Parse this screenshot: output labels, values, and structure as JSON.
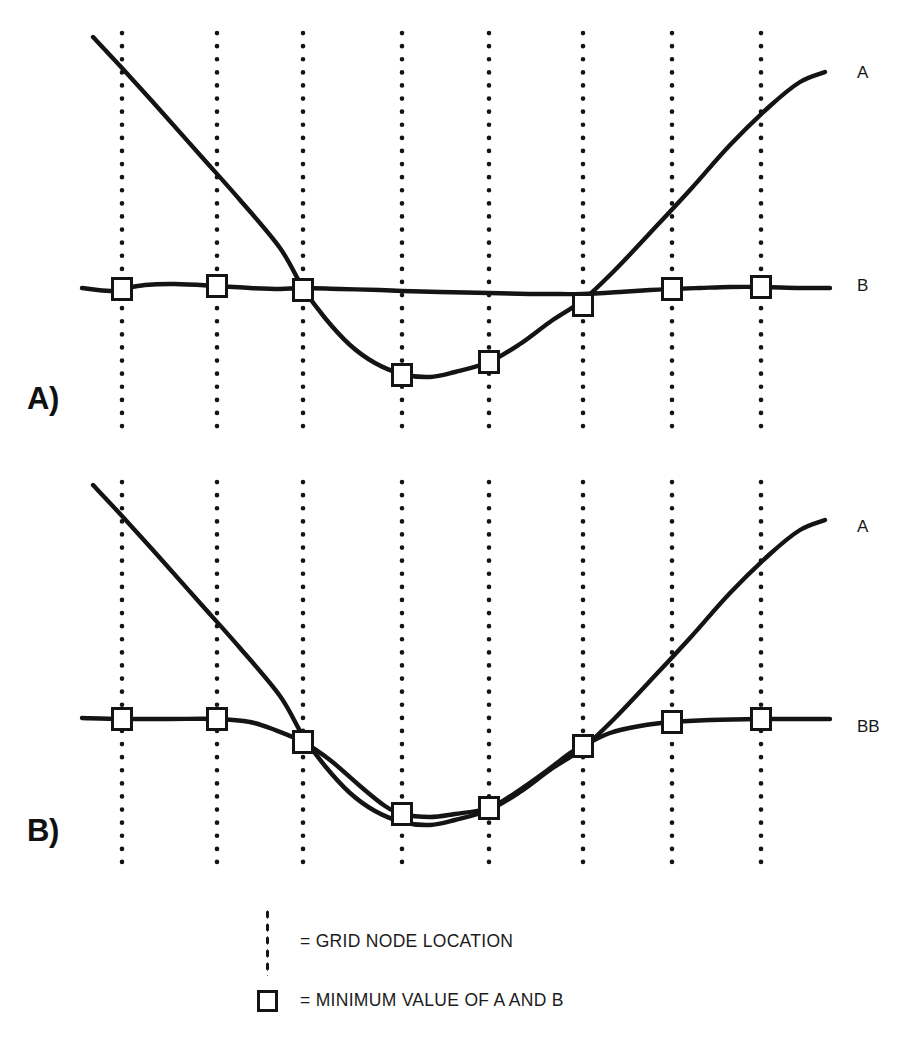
{
  "figure": {
    "background_color": "#ffffff",
    "ink_color": "#141414",
    "panels": [
      {
        "id": "A",
        "caption": "A)",
        "curve_labels": [
          {
            "text": "A",
            "x": 857,
            "y": 64
          },
          {
            "text": "B",
            "x": 857,
            "y": 277
          }
        ]
      },
      {
        "id": "B",
        "caption": "B)",
        "curve_labels": [
          {
            "text": "A",
            "x": 857,
            "y": 518
          },
          {
            "text": "BB",
            "x": 857,
            "y": 718
          }
        ]
      }
    ]
  },
  "legend": {
    "items": [
      {
        "icon": "grid-node-dotted-line-icon",
        "text": "= GRID NODE LOCATION"
      },
      {
        "icon": "minimum-value-square-icon",
        "text": "= MINIMUM VALUE OF A AND B"
      }
    ]
  },
  "bottom_caption": {
    "text": ""
  },
  "chart_data": {
    "type": "line",
    "title": "",
    "xlabel": "",
    "ylabel": "",
    "grid": true,
    "legend_position": "bottom",
    "xlim": [
      0,
      911
    ],
    "ylim_panel_a": [
      30,
      440
    ],
    "ylim_panel_b": [
      480,
      880
    ],
    "grid_nodes": {
      "label": "GRID NODE LOCATION",
      "style": "dotted vertical line",
      "x": [
        122,
        217,
        303,
        402,
        489,
        583,
        672,
        761
      ],
      "panel_a_extent": [
        33,
        437
      ],
      "panel_b_extent": [
        482,
        862
      ]
    },
    "markers": {
      "label": "MINIMUM VALUE OF A AND B",
      "style": "open square",
      "size": 19
    },
    "panel_a": {
      "label": "A)",
      "series": [
        {
          "name": "A",
          "comment": "steep descending limb, parabolic trough, steep ascending limb",
          "points": [
            [
              93,
              37
            ],
            [
              122,
              68
            ],
            [
              160,
              110
            ],
            [
              200,
              155
            ],
            [
              240,
              200
            ],
            [
              280,
              248
            ],
            [
              303,
              288
            ],
            [
              325,
              318
            ],
            [
              350,
              345
            ],
            [
              375,
              363
            ],
            [
              402,
              374
            ],
            [
              430,
              377
            ],
            [
              455,
              372
            ],
            [
              489,
              362
            ],
            [
              520,
              344
            ],
            [
              550,
              322
            ],
            [
              583,
              300
            ],
            [
              615,
              270
            ],
            [
              650,
              233
            ],
            [
              690,
              190
            ],
            [
              730,
              145
            ],
            [
              770,
              106
            ],
            [
              800,
              82
            ],
            [
              825,
              72
            ]
          ]
        },
        {
          "name": "B",
          "comment": "near-horizontal gently undulating curve",
          "points": [
            [
              82,
              288
            ],
            [
              110,
              291
            ],
            [
              122,
              289
            ],
            [
              145,
              285
            ],
            [
              175,
              284
            ],
            [
              217,
              286
            ],
            [
              250,
              288
            ],
            [
              280,
              289
            ],
            [
              303,
              288
            ],
            [
              340,
              289
            ],
            [
              380,
              290
            ],
            [
              402,
              291
            ],
            [
              440,
              292
            ],
            [
              489,
              293
            ],
            [
              530,
              294
            ],
            [
              560,
              294
            ],
            [
              583,
              294
            ],
            [
              620,
              292
            ],
            [
              650,
              290
            ],
            [
              672,
              289
            ],
            [
              700,
              288
            ],
            [
              730,
              287
            ],
            [
              761,
              287
            ],
            [
              800,
              288
            ],
            [
              830,
              288
            ]
          ]
        }
      ],
      "markers": [
        {
          "x": 122,
          "y": 289,
          "on": "B"
        },
        {
          "x": 217,
          "y": 286,
          "on": "B"
        },
        {
          "x": 303,
          "y": 290,
          "on": "B"
        },
        {
          "x": 402,
          "y": 375,
          "on": "A"
        },
        {
          "x": 489,
          "y": 362,
          "on": "A"
        },
        {
          "x": 583,
          "y": 305,
          "on": "A"
        },
        {
          "x": 672,
          "y": 289,
          "on": "B"
        },
        {
          "x": 761,
          "y": 287,
          "on": "B"
        }
      ]
    },
    "panel_b": {
      "label": "B)",
      "series": [
        {
          "name": "A",
          "comment": "same V / parabola form as panel A, shifted down by 455 px",
          "points": [
            [
              93,
              485
            ],
            [
              122,
              516
            ],
            [
              160,
              558
            ],
            [
              200,
              603
            ],
            [
              240,
              648
            ],
            [
              280,
              696
            ],
            [
              303,
              736
            ],
            [
              325,
              766
            ],
            [
              350,
              793
            ],
            [
              375,
              811
            ],
            [
              402,
              822
            ],
            [
              430,
              825
            ],
            [
              455,
              820
            ],
            [
              489,
              810
            ],
            [
              520,
              792
            ],
            [
              550,
              770
            ],
            [
              583,
              748
            ],
            [
              615,
              718
            ],
            [
              650,
              681
            ],
            [
              690,
              638
            ],
            [
              730,
              593
            ],
            [
              770,
              554
            ],
            [
              800,
              530
            ],
            [
              825,
              520
            ]
          ]
        },
        {
          "name": "BB",
          "comment": "smoothed envelope of min(A,B): flat, dips through trough, flat again",
          "points": [
            [
              82,
              718
            ],
            [
              122,
              719
            ],
            [
              170,
              719
            ],
            [
              217,
              719
            ],
            [
              250,
              722
            ],
            [
              275,
              730
            ],
            [
              303,
              742
            ],
            [
              330,
              760
            ],
            [
              360,
              786
            ],
            [
              385,
              806
            ],
            [
              402,
              814
            ],
            [
              430,
              817
            ],
            [
              455,
              814
            ],
            [
              489,
              808
            ],
            [
              515,
              793
            ],
            [
              545,
              772
            ],
            [
              570,
              753
            ],
            [
              583,
              746
            ],
            [
              610,
              733
            ],
            [
              640,
              726
            ],
            [
              672,
              722
            ],
            [
              710,
              720
            ],
            [
              761,
              719
            ],
            [
              800,
              719
            ],
            [
              830,
              719
            ]
          ]
        }
      ],
      "markers": [
        {
          "x": 122,
          "y": 719,
          "on": "BB"
        },
        {
          "x": 217,
          "y": 719,
          "on": "BB"
        },
        {
          "x": 303,
          "y": 742,
          "on": "BB"
        },
        {
          "x": 402,
          "y": 814,
          "on": "BB"
        },
        {
          "x": 489,
          "y": 808,
          "on": "BB"
        },
        {
          "x": 583,
          "y": 746,
          "on": "BB"
        },
        {
          "x": 672,
          "y": 722,
          "on": "BB"
        },
        {
          "x": 761,
          "y": 719,
          "on": "BB"
        }
      ]
    }
  }
}
